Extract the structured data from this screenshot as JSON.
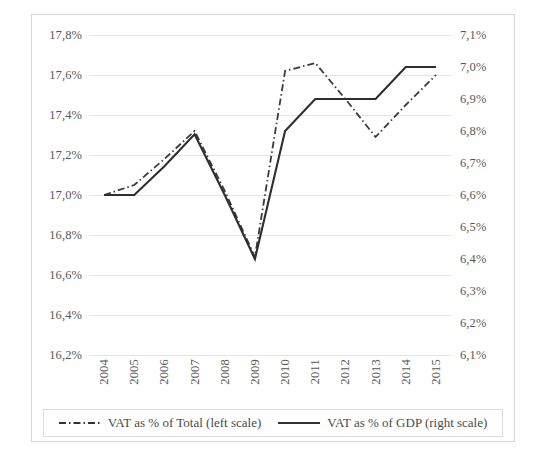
{
  "chart_data": {
    "type": "line",
    "title": "",
    "subtitle": "",
    "xlabel": "",
    "ylabel": "",
    "grid": true,
    "legend_position": "bottom",
    "categories": [
      "2004",
      "2005",
      "2006",
      "2007",
      "2008",
      "2009",
      "2010",
      "2011",
      "2012",
      "2013",
      "2014",
      "2015"
    ],
    "axes": {
      "left": {
        "label": "",
        "ylim": [
          16.2,
          17.8
        ],
        "tick_step": 0.2,
        "tick_labels": [
          "17,8%",
          "17,6%",
          "17,4%",
          "17,2%",
          "17,0%",
          "16,8%",
          "16,6%",
          "16,4%",
          "16,2%"
        ],
        "tick_values": [
          17.8,
          17.6,
          17.4,
          17.2,
          17.0,
          16.8,
          16.6,
          16.4,
          16.2
        ]
      },
      "right": {
        "label": "",
        "ylim": [
          6.1,
          7.1
        ],
        "tick_step": 0.1,
        "tick_labels": [
          "7,1%",
          "7,0%",
          "6,9%",
          "6,8%",
          "6,7%",
          "6,6%",
          "6,5%",
          "6,4%",
          "6,3%",
          "6,2%",
          "6,1%"
        ],
        "tick_values": [
          7.1,
          7.0,
          6.9,
          6.8,
          6.7,
          6.6,
          6.5,
          6.4,
          6.3,
          6.2,
          6.1
        ]
      }
    },
    "series": [
      {
        "name": "VAT as % of Total (left scale)",
        "axis": "left",
        "style": "dash-dot",
        "color": "#3a3a3a",
        "values": [
          17.0,
          17.05,
          17.18,
          17.32,
          17.02,
          16.69,
          17.62,
          17.66,
          17.48,
          17.29,
          17.45,
          17.6
        ]
      },
      {
        "name": "VAT as % of GDP (right scale)",
        "axis": "right",
        "style": "solid",
        "color": "#2e2e2e",
        "values": [
          6.6,
          6.6,
          6.69,
          6.79,
          6.6,
          6.4,
          6.8,
          6.9,
          6.9,
          6.9,
          7.0,
          7.0
        ]
      }
    ]
  },
  "legend": {
    "items": [
      {
        "label": "VAT as % of Total (left scale)",
        "style": "dash-dot"
      },
      {
        "label": "VAT as % of GDP (right scale)",
        "style": "solid"
      }
    ]
  }
}
